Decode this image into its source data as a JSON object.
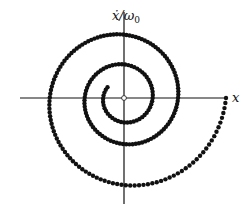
{
  "diagram": {
    "origin": {
      "x": 124,
      "y": 98
    },
    "axes": {
      "x_axis": {
        "label": "x",
        "from": 20,
        "to": 227
      },
      "y_axis": {
        "label_main": "ẋ/ω",
        "label_sub": "0",
        "from": 12,
        "to": 204
      }
    },
    "colors": {
      "line": "#111111",
      "dot": "#111111",
      "origin_fill": "#ffffff"
    },
    "spiral": {
      "r0": 102,
      "decay_per_turn": 0.53,
      "turns": 2.6,
      "dots_per_turn_outer": 41,
      "min_spacing_px": 3.2,
      "dot_radius": 2.2,
      "direction": "clockwise-from-positive-x-through-negative-xdot"
    },
    "origin_marker": "open-circle"
  }
}
